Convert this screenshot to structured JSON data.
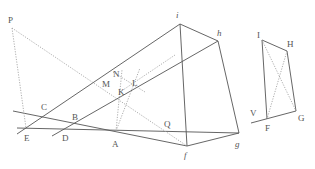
{
  "diagram": {
    "type": "projective-geometry-figure",
    "labels_left": {
      "P": "P",
      "C": "C",
      "B": "B",
      "E": "E",
      "D": "D",
      "A": "A",
      "N": "N",
      "M": "M",
      "K": "K",
      "L": "L",
      "Q": "Q",
      "i": "i",
      "h": "h",
      "f": "f",
      "g": "g"
    },
    "labels_right": {
      "I": "I",
      "H": "H",
      "V": "V",
      "F": "F",
      "G": "G"
    },
    "colors": {
      "solid_line": "#555555",
      "dotted_line": "#999999",
      "label": "#555555",
      "background": "#ffffff"
    }
  }
}
